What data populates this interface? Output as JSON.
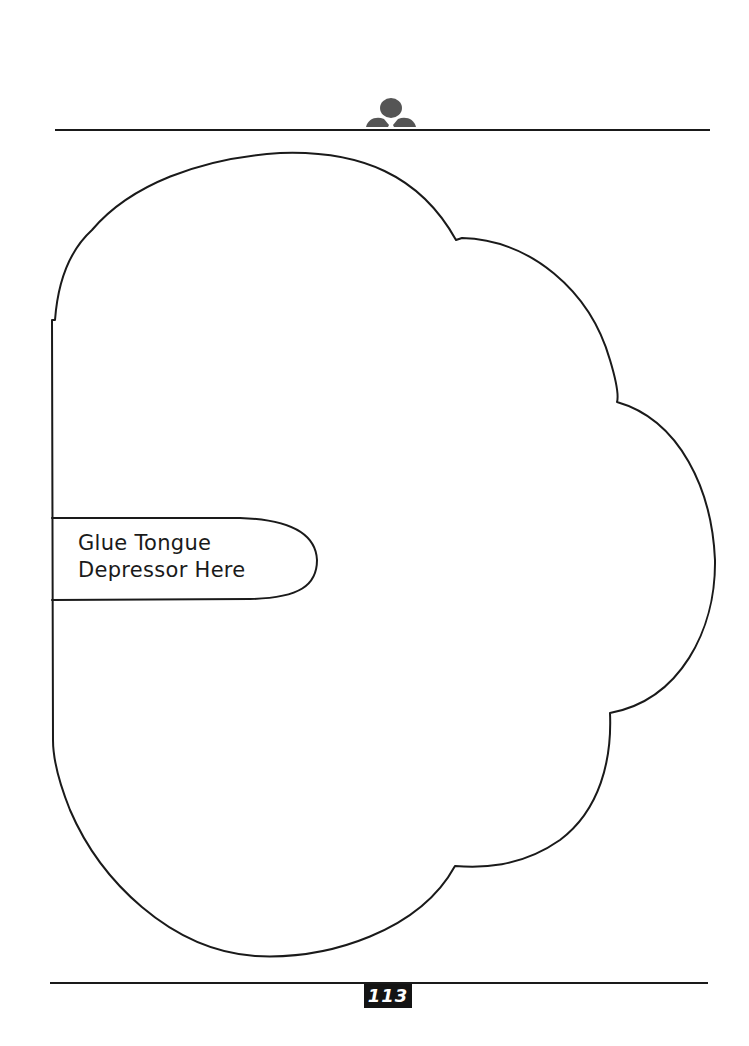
{
  "page": {
    "background_color": "#ffffff",
    "line_color": "#1a1a1a"
  },
  "header": {
    "logo_icon": "figure-logo-icon",
    "logo_color": "#555555"
  },
  "template": {
    "shape": "cloud-outline",
    "tab": {
      "label_line_1": "Glue Tongue",
      "label_line_2": "Depressor Here"
    }
  },
  "footer": {
    "page_number": "113",
    "page_number_bg": "#141414",
    "page_number_color": "#ffffff"
  }
}
